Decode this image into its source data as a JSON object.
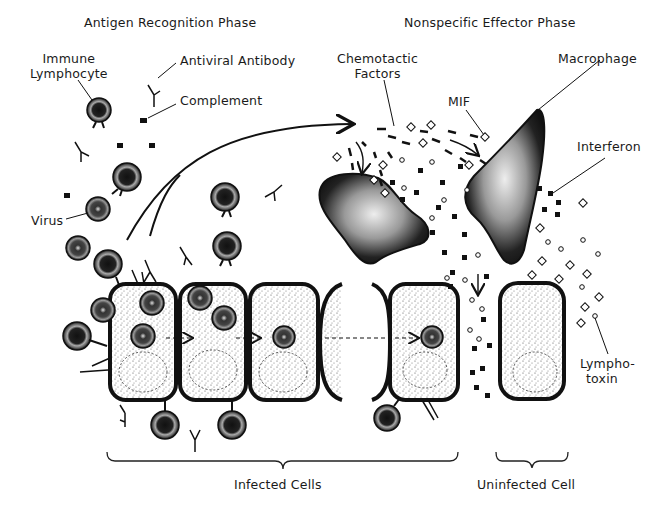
{
  "headings": {
    "left_phase": "Antigen Recognition Phase",
    "right_phase": "Nonspecific Effector Phase"
  },
  "labels": {
    "immune_lymphocyte": [
      "Immune",
      "Lymphocyte"
    ],
    "antiviral_antibody": "Antiviral Antibody",
    "complement": "Complement",
    "virus": "Virus",
    "chemotactic_factors": [
      "Chemotactic",
      "Factors"
    ],
    "mif": "MIF",
    "macrophage": "Macrophage",
    "interferon": "Interferon",
    "lymphotoxin": [
      "Lympho-",
      "toxin"
    ]
  },
  "groups": {
    "infected": "Infected Cells",
    "uninfected": "Uninfected Cell"
  },
  "colors": {
    "ink": "#111111",
    "background": "#ffffff",
    "stipple": "#7a7a7a"
  }
}
